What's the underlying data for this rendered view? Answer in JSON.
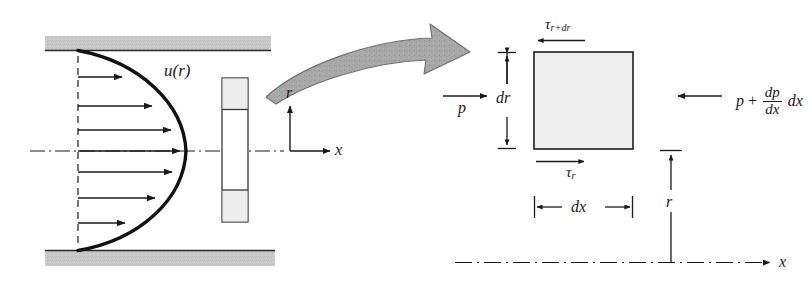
{
  "figure": {
    "colors": {
      "wall_fill": "#c9c9c9",
      "wall_edge": "#2b2b2b",
      "element_fill": "#eeeeee",
      "element_edge": "#3a3a3a",
      "big_arrow_fill": "#a8a8a8",
      "big_arrow_edge": "#6f6f6f",
      "line": "#1a1a1a",
      "background": "#ffffff"
    }
  },
  "left_diagram": {
    "name": "pipe-flow-velocity-profile",
    "velocity_profile_label": "u(r)",
    "axis_r_label": "r",
    "axis_x_label": "x",
    "walls": {
      "top_label": "pipe-wall-top",
      "bottom_label": "pipe-wall-bottom"
    },
    "centerline_label": "pipe-centerline",
    "arrow_count": 7,
    "element_label": "annular-fluid-element"
  },
  "right_diagram": {
    "name": "fluid-element-force-balance",
    "shear_top": {
      "symbol": "τ",
      "subscript": "r+dr",
      "direction": "left"
    },
    "shear_bottom": {
      "symbol": "τ",
      "subscript": "r",
      "direction": "right"
    },
    "pressure_left": {
      "label": "p",
      "direction": "right"
    },
    "pressure_right": {
      "base": "p",
      "operator": "+",
      "fraction_numerator": "dp",
      "fraction_denominator": "dx",
      "tail": "dx",
      "direction": "left"
    },
    "dim_dr": "dr",
    "dim_dx": "dx",
    "dim_r": "r",
    "axis_x_label": "x",
    "centerline_label": "pipe-centerline-right"
  }
}
